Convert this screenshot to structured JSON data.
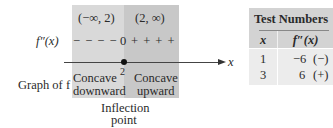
{
  "sign_chart": {
    "intervals": [
      {
        "label": "(−∞, 2)",
        "signs": "− − − −",
        "concavity_line1": "Concave",
        "concavity_line2": "downward"
      },
      {
        "label": "(2, ∞)",
        "signs": "+ + + +",
        "concavity_line1": "Concave",
        "concavity_line2": "upward"
      }
    ],
    "row_labels": {
      "second_derivative": "f″(x)",
      "graph": "Graph of f"
    },
    "zero_marker": "0",
    "critical_point": "2",
    "axis_label": "x",
    "annotation_line1": "Inflection",
    "annotation_line2": "point",
    "colors": {
      "left_panel": "#d9d9d9",
      "right_panel": "#c8c8c8"
    }
  },
  "test_table": {
    "title": "Test Numbers",
    "headers": [
      "x",
      "f″(x)"
    ],
    "rows": [
      {
        "x": "1",
        "value": "−6",
        "sign": "(−)"
      },
      {
        "x": "3",
        "value": "6",
        "sign": "(+)"
      }
    ]
  }
}
